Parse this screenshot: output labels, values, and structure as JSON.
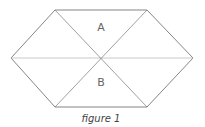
{
  "figure": {
    "caption": "figure 1",
    "stroke_color": "#777777",
    "diagonal_color": "#999999",
    "midline_color": "#bbbbbb",
    "vertices": {
      "top_left": [
        55,
        10
      ],
      "top_right": [
        147,
        10
      ],
      "right": [
        193,
        58
      ],
      "bottom_right": [
        147,
        107
      ],
      "bottom_left": [
        55,
        107
      ],
      "left": [
        11,
        58
      ],
      "center": [
        101,
        58
      ]
    },
    "regions": [
      {
        "label": "A",
        "x": 101,
        "y": 31
      },
      {
        "label": "B",
        "x": 101,
        "y": 86
      }
    ]
  }
}
